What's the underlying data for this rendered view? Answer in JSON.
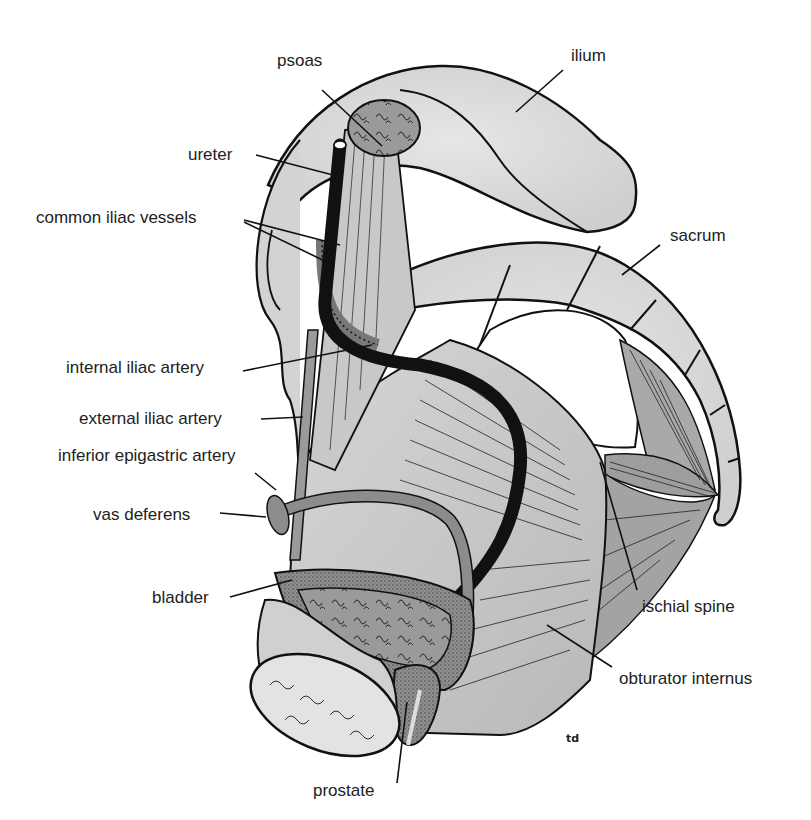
{
  "figure": {
    "signature": "td",
    "colors": {
      "bone": "#d9d9d9",
      "bone_dark": "#c4c4c4",
      "muscle": "#bdbdbd",
      "ureter": "#111111",
      "vessel": "#8a8a8a",
      "outline": "#111111",
      "label": "#222222"
    }
  },
  "labels": [
    {
      "id": "psoas",
      "text": "psoas",
      "x": 277,
      "y": 62,
      "line": [
        322,
        90,
        382,
        146
      ]
    },
    {
      "id": "ilium",
      "text": "ilium",
      "x": 571,
      "y": 48,
      "line": [
        563,
        70,
        516,
        112
      ]
    },
    {
      "id": "ureter",
      "text": "ureter",
      "x": 188,
      "y": 146,
      "line": [
        256,
        155,
        333,
        175
      ]
    },
    {
      "id": "common-iliac-vessels",
      "text": "common iliac vessels",
      "x": 36,
      "y": 209,
      "line": [
        244,
        220,
        340,
        245
      ],
      "line2": [
        244,
        222,
        333,
        265
      ]
    },
    {
      "id": "sacrum",
      "text": "sacrum",
      "x": 670,
      "y": 227,
      "line": [
        660,
        245,
        622,
        275
      ]
    },
    {
      "id": "internal-iliac-artery",
      "text": "internal iliac artery",
      "x": 66,
      "y": 359,
      "line": [
        243,
        371,
        372,
        345
      ]
    },
    {
      "id": "external-iliac-artery",
      "text": "external iliac artery",
      "x": 79,
      "y": 410,
      "line": [
        261,
        419,
        303,
        417
      ]
    },
    {
      "id": "inferior-epigastric-artery",
      "text": "inferior epigastric artery",
      "x": 58,
      "y": 447,
      "line": [
        255,
        473,
        276,
        490
      ]
    },
    {
      "id": "vas-deferens",
      "text": "vas deferens",
      "x": 93,
      "y": 506,
      "line": [
        220,
        513,
        266,
        517
      ]
    },
    {
      "id": "bladder",
      "text": "bladder",
      "x": 152,
      "y": 589,
      "line": [
        230,
        597,
        292,
        580
      ]
    },
    {
      "id": "ischial-spine",
      "text": "ischial spine",
      "x": 642,
      "y": 598,
      "line": [
        637,
        590,
        600,
        462
      ]
    },
    {
      "id": "obturator-internus",
      "text": "obturator internus",
      "x": 619,
      "y": 670,
      "line": [
        612,
        667,
        547,
        625
      ]
    },
    {
      "id": "prostate",
      "text": "prostate",
      "x": 313,
      "y": 782,
      "line": [
        397,
        783,
        407,
        702
      ]
    }
  ]
}
